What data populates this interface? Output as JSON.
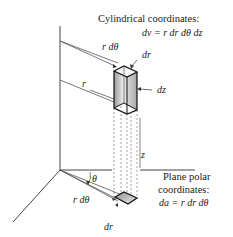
{
  "cylindrical": {
    "title": "Cylindrical coordinates:",
    "formula": "dv = r dr dθ dz"
  },
  "polar": {
    "title_line1": "Plane polar",
    "title_line2": "coordinates:",
    "formula": "da = r dr dθ"
  },
  "labels": {
    "r_dtheta_top": "r dθ",
    "dr_top": "dr",
    "dz": "dz",
    "r": "r",
    "z": "z",
    "theta": "θ",
    "r_dtheta_bottom": "r dθ",
    "dr_bottom": "dr"
  },
  "colors": {
    "stroke": "#222222",
    "light_stroke": "#555555",
    "shade": "#bbbbbb"
  }
}
